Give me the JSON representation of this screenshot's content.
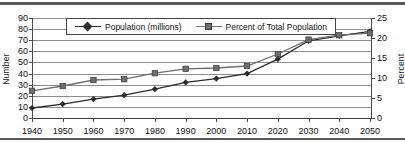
{
  "figure": {
    "name": "population-and-percent-line-chart"
  },
  "axes": {
    "left_title": "Number",
    "right_title": "Percent",
    "left_ticks": [
      "0",
      "10",
      "20",
      "30",
      "40",
      "50",
      "60",
      "70",
      "80",
      "90"
    ],
    "right_ticks": [
      "0",
      "5",
      "10",
      "15",
      "20",
      "25"
    ],
    "x_ticks": [
      "1940",
      "1950",
      "1960",
      "1970",
      "1980",
      "1990",
      "2000",
      "2010",
      "2020",
      "2030",
      "2040",
      "2050"
    ]
  },
  "legend": {
    "position": "top-center",
    "items": [
      {
        "label": "Population (millions)",
        "marker": "diamond-marker",
        "color": "#2b2b2b"
      },
      {
        "label": "Percent of Total Population",
        "marker": "square-marker",
        "color": "#6e6e6e"
      }
    ]
  },
  "chart_data": {
    "type": "line",
    "title": "",
    "subtitle": "",
    "xlabel": "",
    "ylabel": "Number",
    "y2label": "Percent",
    "x": [
      1940,
      1950,
      1960,
      1970,
      1980,
      1990,
      2000,
      2010,
      2020,
      2030,
      2040,
      2050
    ],
    "categories": [
      "1940",
      "1950",
      "1960",
      "1970",
      "1980",
      "1990",
      "2000",
      "2010",
      "2020",
      "2030",
      "2040",
      "2050"
    ],
    "xlim": [
      1940,
      2050
    ],
    "ylim": [
      0,
      90
    ],
    "y2lim": [
      0,
      25
    ],
    "ytick_step": 10,
    "y2tick_step": 5,
    "grid": "horizontal",
    "legend_position": "top-center",
    "series": [
      {
        "name": "Population (millions)",
        "axis": "left",
        "marker": "diamond",
        "color": "#2b2b2b",
        "values": [
          9,
          12.5,
          17,
          20.5,
          26,
          32,
          35.5,
          40,
          53,
          69.5,
          74,
          78
        ]
      },
      {
        "name": "Percent of Total Population",
        "axis": "right",
        "marker": "square",
        "color": "#6e6e6e",
        "values": [
          6.8,
          8,
          9.5,
          9.7,
          11.2,
          12.3,
          12.5,
          13,
          16,
          19.6,
          20.7,
          21.2
        ]
      }
    ]
  }
}
